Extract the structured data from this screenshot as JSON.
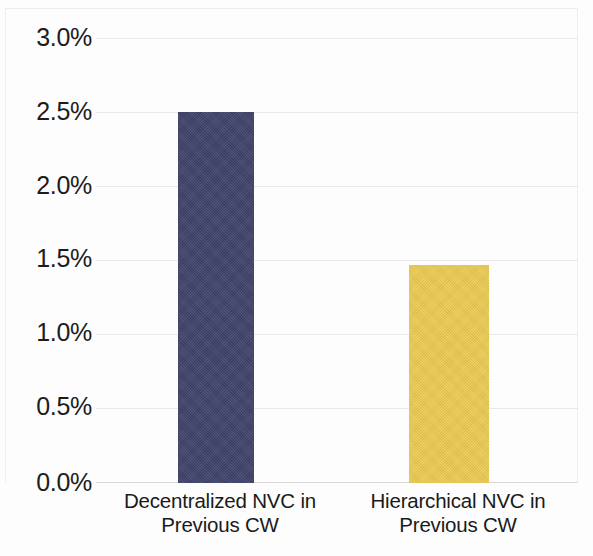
{
  "chart_data": {
    "type": "bar",
    "title": "",
    "subtitle": "",
    "xlabel": "",
    "ylabel": "",
    "categories": [
      "Decentralized NVC in\nPrevious CW",
      "Hierarchical NVC in\nPrevious CW"
    ],
    "values": [
      2.5,
      1.47
    ],
    "value_labels": [
      "2.5%",
      "1.47%"
    ],
    "bar_colors": [
      "#3e4169",
      "#ecca52"
    ],
    "ylim": [
      0.0,
      3.0
    ],
    "ytick_values": [
      0.0,
      0.5,
      1.0,
      1.5,
      2.0,
      2.5,
      3.0
    ],
    "ytick_labels": [
      "0.0%",
      "0.5%",
      "1.0%",
      "1.5%",
      "2.0%",
      "2.5%",
      "3.0%"
    ],
    "grid": true,
    "grid_axis": "y",
    "legend": false,
    "legend_position": "none",
    "unit": "%"
  },
  "axis": {
    "y_labels": [
      {
        "text": "3.0%",
        "value": 3.0
      },
      {
        "text": "2.5%",
        "value": 2.5
      },
      {
        "text": "2.0%",
        "value": 2.0
      },
      {
        "text": "1.5%",
        "value": 1.5
      },
      {
        "text": "1.0%",
        "value": 1.0
      },
      {
        "text": "0.5%",
        "value": 0.5
      },
      {
        "text": "0.0%",
        "value": 0.0
      }
    ],
    "x_labels": [
      {
        "line1": "Decentralized NVC in",
        "line2": "Previous CW"
      },
      {
        "line1": "Hierarchical NVC in",
        "line2": "Previous CW"
      }
    ]
  },
  "bars": [
    {
      "category": "Decentralized NVC in Previous CW",
      "value": 2.5,
      "color": "#3e4169"
    },
    {
      "category": "Hierarchical NVC in Previous CW",
      "value": 1.47,
      "color": "#ecca52"
    }
  ],
  "colors": {
    "background": "#fdfdfd",
    "gridline": "#e9e9e9",
    "baseline": "#d8d8d8",
    "text": "#1c1c1c",
    "series_1": "#3e4169",
    "series_2": "#ecca52"
  }
}
